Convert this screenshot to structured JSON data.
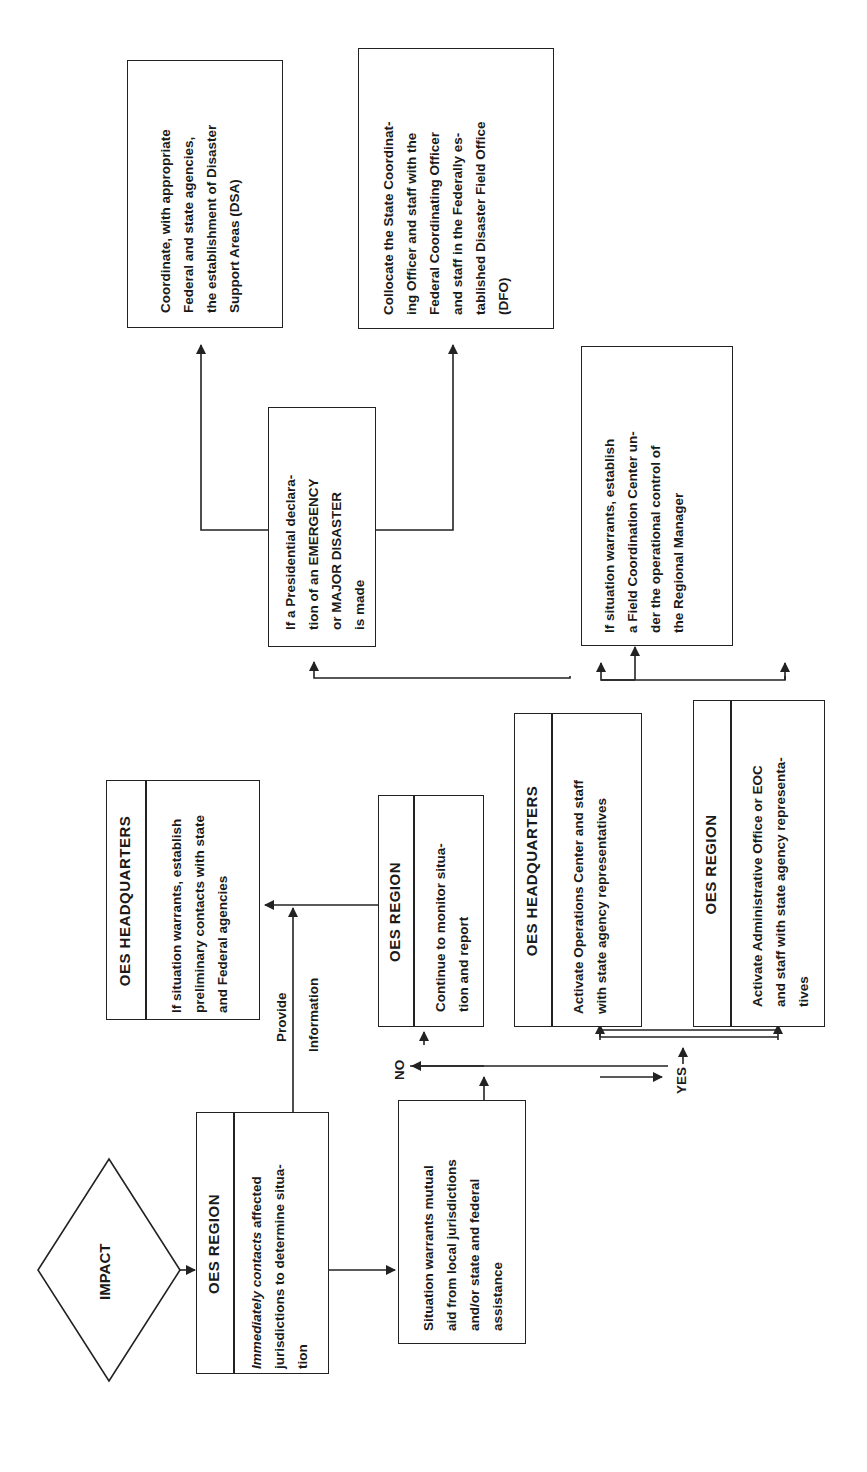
{
  "diagram": {
    "orientation": "rotated 90° counter-clockwise (text reads bottom to top)",
    "start": {
      "label": "IMPACT",
      "shape": "diamond"
    },
    "nodes": {
      "oes_region_initial": {
        "header": "OES REGION",
        "text_italic_part": "Immediately contacts",
        "text": " affected\njurisdictions to determine situa-\ntion"
      },
      "oes_hq_preliminary": {
        "header": "OES HEADQUARTERS",
        "text": "If situation warrants, establish\npreliminary contacts with state\nand Federal agencies"
      },
      "mutual_aid_decision": {
        "text": "Situation warrants mutual\naid from local jurisdictions\nand/or state and federal\nassistance"
      },
      "oes_region_monitor": {
        "header": "OES REGION",
        "text": "Continue to monitor situa-\ntion and report"
      },
      "oes_hq_activate": {
        "header": "OES HEADQUARTERS",
        "text": "Activate Operations Center and staff\nwith state agency representatives"
      },
      "oes_region_activate": {
        "header": "OES REGION",
        "text": "Activate Administrative Office or EOC\nand staff with state agency representa-\ntives"
      },
      "presidential_declaration": {
        "text": "If a Presidential declara-\ntion of an EMERGENCY\nor MAJOR DISASTER\nis made"
      },
      "field_coordination": {
        "text": "If situation warrants, establish\na Field Coordination Center un-\nder the operational control of\nthe Regional Manager"
      },
      "dsa": {
        "text": "Coordinate, with appropriate\nFederal and state agencies,\nthe establishment of Disaster\nSupport Areas (DSA)"
      },
      "dfo": {
        "text": "Collocate the State Coordinat-\ning Officer and staff with the\nFederal Coordinating Officer\nand staff in the Federally es-\ntablished Disaster Field Office\n(DFO)"
      }
    },
    "edge_labels": {
      "provide": "Provide",
      "information": "Information",
      "no": "NO",
      "yes": "YES"
    },
    "colors": {
      "line": "#222222",
      "background": "#ffffff",
      "text": "#1a1a1a"
    }
  }
}
